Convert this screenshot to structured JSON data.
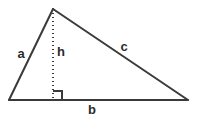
{
  "diagram": {
    "type": "geometry-triangle",
    "canvas": {
      "width": 198,
      "height": 123,
      "background": "#ffffff"
    },
    "stroke": {
      "color": "#3a3a3a",
      "width": 2
    },
    "label_color": "#2b2b2b",
    "vertices": {
      "left": {
        "x": 9,
        "y": 100
      },
      "apex": {
        "x": 53,
        "y": 9
      },
      "right": {
        "x": 188,
        "y": 100
      },
      "foot": {
        "x": 53,
        "y": 100
      }
    },
    "labels": {
      "a": {
        "text": "a",
        "x": 21,
        "y": 53
      },
      "h": {
        "text": "h",
        "x": 61,
        "y": 51
      },
      "c": {
        "text": "c",
        "x": 124,
        "y": 46
      },
      "b": {
        "text": "b",
        "x": 92,
        "y": 109
      }
    },
    "altitude": {
      "style": "dotted",
      "dash": "1,3"
    },
    "right_angle_marker": {
      "size": 9,
      "x": 53,
      "y": 100,
      "side": "right"
    }
  }
}
